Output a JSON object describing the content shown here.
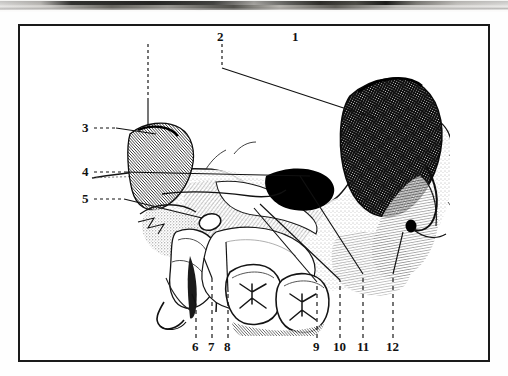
{
  "figure": {
    "type": "anatomical-line-illustration",
    "frame": {
      "x": 18,
      "y": 24,
      "width": 472,
      "height": 338,
      "border_color": "#1a1a1a"
    },
    "background_color": "#ffffff",
    "ink_color": "#111111"
  },
  "top_strip": {
    "name": "partial-photograph-remnant",
    "description": "blurred grayscale photographic band cropped at the top edge of the page",
    "height": 13,
    "colors": [
      "#f4f4f2",
      "#9a9a98",
      "#4a4a48",
      "#242423",
      "#dedcd8"
    ]
  },
  "labels": [
    {
      "id": "1",
      "text": "1",
      "x": 290,
      "y": 27,
      "leader": "dashed-vertical-then-diagonal",
      "target_x": 372,
      "target_y": 90
    },
    {
      "id": "2",
      "text": "2",
      "x": 215,
      "y": 27,
      "leader": "dashed-vertical",
      "target_x": 219,
      "target_y": 96
    },
    {
      "id": "3",
      "text": "3",
      "x": 84,
      "y": 120,
      "leader": "dashed-then-solid-horizontal",
      "target_x": 136,
      "target_y": 125
    },
    {
      "id": "4",
      "text": "4",
      "x": 84,
      "y": 164,
      "leader": "dashed-then-solid-horizontal",
      "target_x": 236,
      "target_y": 168
    },
    {
      "id": "5",
      "text": "5",
      "x": 84,
      "y": 191,
      "leader": "dashed-then-solid-horizontal",
      "target_x": 190,
      "target_y": 195
    },
    {
      "id": "6",
      "text": "6",
      "x": 188,
      "y": 341,
      "leader": "dashed-vertical",
      "target_x": 192,
      "target_y": 300
    },
    {
      "id": "7",
      "text": "7",
      "x": 204,
      "y": 341,
      "leader": "dashed-vertical",
      "target_x": 208,
      "target_y": 268
    },
    {
      "id": "8",
      "text": "8",
      "x": 221,
      "y": 341,
      "leader": "dashed-vertical",
      "target_x": 225,
      "target_y": 284
    },
    {
      "id": "9",
      "text": "9",
      "x": 309,
      "y": 341,
      "leader": "dashed-vertical-then-diagonal",
      "target_x": 248,
      "target_y": 205
    },
    {
      "id": "10",
      "text": "10",
      "x": 331,
      "y": 341,
      "leader": "dashed-vertical-then-diagonal",
      "target_x": 254,
      "target_y": 200
    },
    {
      "id": "11",
      "text": "11",
      "x": 356,
      "y": 341,
      "leader": "dashed-vertical-then-diagonal",
      "target_x": 292,
      "target_y": 166
    },
    {
      "id": "12",
      "text": "12",
      "x": 385,
      "y": 341,
      "leader": "dashed-vertical",
      "target_x": 391,
      "target_y": 200
    }
  ]
}
